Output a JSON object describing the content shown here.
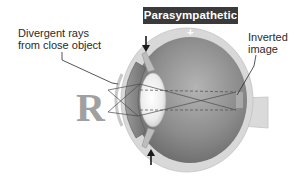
{
  "title": "Parasympathetic +",
  "labels": {
    "divergent_line1": "Divergent rays",
    "divergent_line2": "from close object",
    "inverted_line1": "Inverted",
    "inverted_line2": "image"
  },
  "object_letter": "R",
  "image_letter": "R",
  "colors": {
    "title_bg": "#3a3a3a",
    "title_fg": "#ffffff",
    "sclera": "#d6d6d6",
    "eye_interior": "#8a8a8a",
    "lens": "#f2f2f2",
    "object_letter": "#a0a0a0",
    "rays": "#555555"
  }
}
